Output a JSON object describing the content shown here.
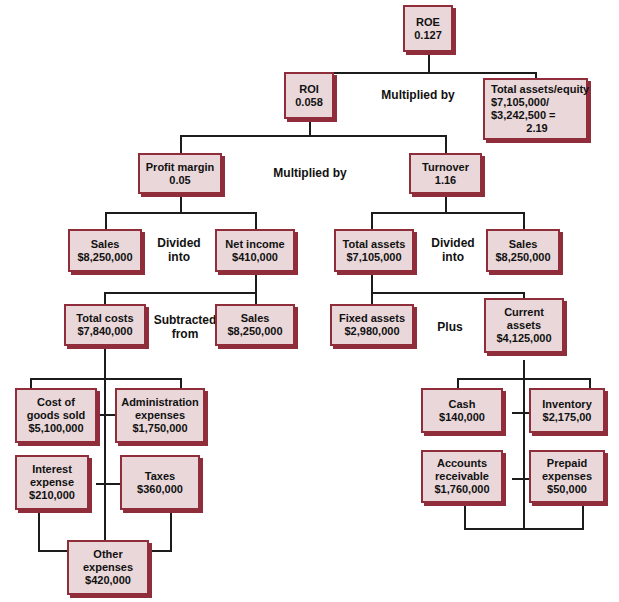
{
  "diagram": {
    "type": "dupont-analysis-tree",
    "nodes": {
      "roe": {
        "label": "ROE",
        "value": "0.127"
      },
      "roi": {
        "label": "ROI",
        "value": "0.058"
      },
      "assets_equity": {
        "label": "Total assets/equity",
        "line2": "$7,105,000/",
        "line3": "$3,242,500 =",
        "value": "2.19"
      },
      "profit_margin": {
        "label": "Profit margin",
        "value": "0.05"
      },
      "turnover": {
        "label": "Turnover",
        "value": "1.16"
      },
      "sales_left": {
        "label": "Sales",
        "value": "$8,250,000"
      },
      "net_income": {
        "label": "Net income",
        "value": "$410,000"
      },
      "total_assets": {
        "label": "Total assets",
        "value": "$7,105,000"
      },
      "sales_right": {
        "label": "Sales",
        "value": "$8,250,000"
      },
      "total_costs": {
        "label": "Total costs",
        "value": "$7,840,000"
      },
      "sales_sub": {
        "label": "Sales",
        "value": "$8,250,000"
      },
      "fixed_assets": {
        "label": "Fixed assets",
        "value": "$2,980,000"
      },
      "current_assets": {
        "label": "Current",
        "line2": "assets",
        "value": "$4,125,000"
      },
      "cogs": {
        "label": "Cost of",
        "line2": "goods sold",
        "value": "$5,100,000"
      },
      "admin": {
        "label": "Administration",
        "line2": "expenses",
        "value": "$1,750,000"
      },
      "interest": {
        "label": "Interest",
        "line2": "expense",
        "value": "$210,000"
      },
      "taxes": {
        "label": "Taxes",
        "value": "$360,000"
      },
      "other_exp": {
        "label": "Other",
        "line2": "expenses",
        "value": "$420,000"
      },
      "cash": {
        "label": "Cash",
        "value": "$140,000"
      },
      "inventory": {
        "label": "Inventory",
        "value": "$2,175,00"
      },
      "accounts_rec": {
        "label": "Accounts",
        "line2": "receivable",
        "value": "$1,760,000"
      },
      "prepaid": {
        "label": "Prepaid",
        "line2": "expenses",
        "value": "$50,000"
      }
    },
    "operators": {
      "multiplied_top": {
        "line1": "Multiplied by"
      },
      "multiplied_mid": {
        "line1": "Multiplied by"
      },
      "divided_left": {
        "line1": "Divided",
        "line2": "into"
      },
      "divided_right": {
        "line1": "Divided",
        "line2": "into"
      },
      "subtracted_from": {
        "line1": "Subtracted",
        "line2": "from"
      },
      "plus": {
        "line1": "Plus"
      }
    },
    "colors": {
      "box_fill": "#e9d7d9",
      "box_border": "#8f2d3b",
      "line": "#1c1c1c",
      "text": "#111111",
      "background": "#ffffff"
    }
  }
}
